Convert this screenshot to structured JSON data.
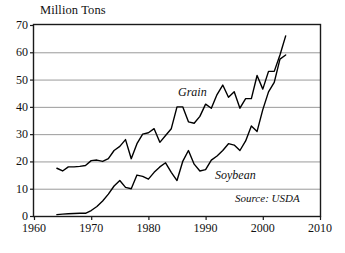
{
  "chart_data": {
    "type": "line",
    "title": "Million Tons",
    "xlabel": "",
    "ylabel": "Million Tons",
    "xlim": [
      1960,
      2010
    ],
    "ylim": [
      0,
      70
    ],
    "xticks": [
      1960,
      1970,
      1980,
      1990,
      2000,
      2010
    ],
    "yticks": [
      0,
      10,
      20,
      30,
      40,
      50,
      60,
      70
    ],
    "grid": "horizontal",
    "legend": "inline-annotations",
    "annotations": [
      {
        "text": "Grain",
        "x": 1986,
        "y": 46
      },
      {
        "text": "Soybean",
        "x": 1992,
        "y": 16
      },
      {
        "text": "Source: USDA",
        "x": 2000,
        "y": 7
      }
    ],
    "series": [
      {
        "name": "Grain",
        "x": [
          1964,
          1965,
          1966,
          1967,
          1968,
          1969,
          1970,
          1971,
          1972,
          1973,
          1974,
          1975,
          1976,
          1977,
          1978,
          1979,
          1980,
          1981,
          1982,
          1983,
          1984,
          1985,
          1986,
          1987,
          1988,
          1989,
          1990,
          1991,
          1992,
          1993,
          1994,
          1995,
          1996,
          1997,
          1998,
          1999,
          2000,
          2001,
          2002,
          2003,
          2004
        ],
        "values": [
          17.5,
          16.5,
          18.0,
          18.0,
          18.2,
          18.5,
          20.3,
          20.5,
          20.0,
          21.0,
          24.0,
          25.5,
          28.0,
          21.0,
          26.5,
          30.0,
          30.5,
          32.0,
          27.0,
          29.5,
          32.0,
          40.0,
          40.0,
          34.5,
          34.0,
          36.5,
          41.0,
          39.5,
          44.5,
          48.0,
          43.5,
          45.5,
          39.5,
          43.0,
          43.0,
          51.5,
          46.5,
          53.0,
          53.0,
          59.0,
          66.0
        ]
      },
      {
        "name": "Soybean",
        "x": [
          1964,
          1965,
          1966,
          1967,
          1968,
          1969,
          1970,
          1971,
          1972,
          1973,
          1974,
          1975,
          1976,
          1977,
          1978,
          1979,
          1980,
          1981,
          1982,
          1983,
          1984,
          1985,
          1986,
          1987,
          1988,
          1989,
          1990,
          1991,
          1992,
          1993,
          1994,
          1995,
          1996,
          1997,
          1998,
          1999,
          2000,
          2001,
          2002,
          2003,
          2004
        ],
        "values": [
          0.5,
          0.7,
          0.8,
          0.9,
          1.0,
          1.0,
          2.0,
          3.5,
          5.5,
          8.0,
          11.0,
          13.0,
          10.5,
          10.0,
          15.0,
          14.5,
          13.5,
          16.0,
          18.0,
          19.5,
          16.0,
          13.0,
          20.0,
          24.0,
          19.0,
          16.5,
          17.0,
          20.5,
          22.0,
          24.0,
          26.5,
          26.0,
          24.0,
          27.5,
          33.0,
          31.0,
          39.0,
          45.5,
          49.0,
          57.5,
          59.0
        ]
      }
    ]
  },
  "axis": {
    "y_tick_labels": [
      "70",
      "60",
      "50",
      "40",
      "30",
      "20",
      "10",
      "0"
    ],
    "x_tick_labels": [
      "1960",
      "1970",
      "1980",
      "1990",
      "2000",
      "2010"
    ],
    "unit_title": "Million Tons"
  },
  "labels": {
    "grain": "Grain",
    "soybean": "Soybean",
    "source": "Source: USDA"
  },
  "colors": {
    "line": "#000000",
    "grid": "#9a9a9a",
    "frame": "#1a1a1a",
    "background": "#ffffff",
    "text": "#111111"
  }
}
